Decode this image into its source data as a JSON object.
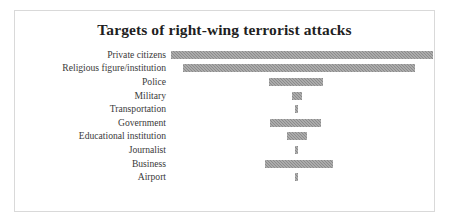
{
  "figure": {
    "title": "Targets of right-wing terrorist attacks",
    "frame_color": "#d9d9d9",
    "background": "#ffffff"
  },
  "chart_data": {
    "type": "bar",
    "orientation": "horizontal",
    "alignment": "center",
    "title": "Targets of right-wing terrorist attacks",
    "subtitle": "",
    "xlabel": "",
    "ylabel": "",
    "grid": false,
    "legend": false,
    "axis_ticks_visible": false,
    "bar_color": "#8b8b8b",
    "bar_pattern": "cross-hatch",
    "categories": [
      "Private citizens",
      "Religious figure/institution",
      "Police",
      "Military",
      "Transportation",
      "Government",
      "Educational institution",
      "Journalist",
      "Business",
      "Airport"
    ],
    "values": [
      262,
      232,
      54,
      10,
      3,
      51,
      20,
      3,
      68,
      3
    ],
    "value_units": "pixels (relative magnitude; no numeric axis shown)",
    "xlim": [
      0,
      262
    ],
    "bars": [
      {
        "label": "Private citizens",
        "value": 262,
        "width_px": 262,
        "left_px": 156
      },
      {
        "label": "Religious figure/institution",
        "value": 232,
        "width_px": 232,
        "left_px": 168
      },
      {
        "label": "Police",
        "value": 54,
        "width_px": 54,
        "left_px": 254
      },
      {
        "label": "Military",
        "value": 10,
        "width_px": 10,
        "left_px": 277
      },
      {
        "label": "Transportation",
        "value": 3,
        "width_px": 3,
        "left_px": 280
      },
      {
        "label": "Government",
        "value": 51,
        "width_px": 51,
        "left_px": 255
      },
      {
        "label": "Educational institution",
        "value": 20,
        "width_px": 20,
        "left_px": 272
      },
      {
        "label": "Journalist",
        "value": 3,
        "width_px": 3,
        "left_px": 280
      },
      {
        "label": "Business",
        "value": 68,
        "width_px": 68,
        "left_px": 250
      },
      {
        "label": "Airport",
        "value": 3,
        "width_px": 3,
        "left_px": 280
      }
    ]
  }
}
